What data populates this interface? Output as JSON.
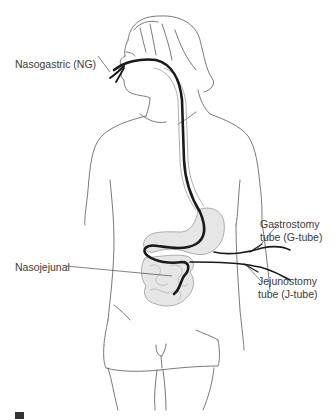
{
  "figure": {
    "type": "anatomical-diagram",
    "labels": {
      "ng": "Nasogastric (NG)",
      "g_tube_line1": "Gastrostomy",
      "g_tube_line2": "tube (G-tube)",
      "nj": "Nasojejunal",
      "j_tube_line1": "Jejunostomy",
      "j_tube_line2": "tube (J-tube)"
    },
    "colors": {
      "outline": "#6a6a6a",
      "tube": "#1a1a1a",
      "organ_fill": "#e6e6e6",
      "leader": "#4a4a4a"
    }
  }
}
